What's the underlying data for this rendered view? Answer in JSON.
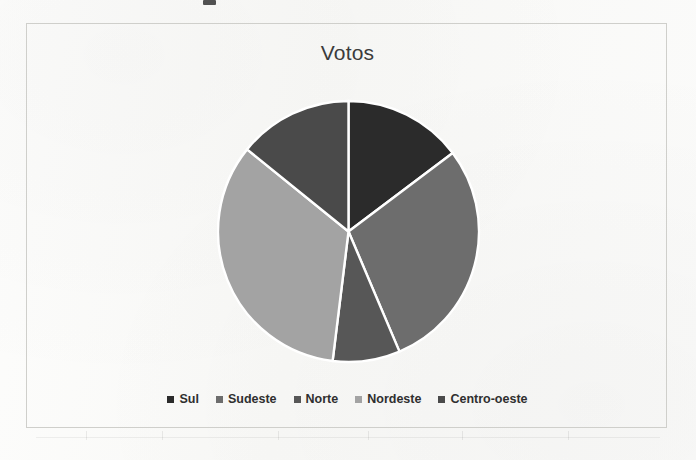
{
  "chart_data": {
    "type": "pie",
    "title": "Votos",
    "categories": [
      "Sul",
      "Sudeste",
      "Norte",
      "Nordeste",
      "Centro-oeste"
    ],
    "values": [
      14.7,
      28.9,
      8.3,
      33.9,
      14.2
    ],
    "units": "percent",
    "angles_deg": [
      53,
      104,
      30,
      122,
      51
    ],
    "start_angle_deg": 0,
    "direction": "clockwise",
    "colors": [
      "#2b2b2b",
      "#6d6d6d",
      "#575757",
      "#a3a3a3",
      "#4a4a4a"
    ],
    "slice_border_color": "#ffffff",
    "legend_position": "bottom",
    "grid": false,
    "xlabel": "",
    "ylabel": ""
  },
  "frame": {
    "border_color": "#cfcfcb"
  },
  "legend": {
    "items": [
      {
        "label": "Sul",
        "color": "#2b2b2b"
      },
      {
        "label": "Sudeste",
        "color": "#6d6d6d"
      },
      {
        "label": "Norte",
        "color": "#575757"
      },
      {
        "label": "Nordeste",
        "color": "#a3a3a3"
      },
      {
        "label": "Centro-oeste",
        "color": "#4a4a4a"
      }
    ]
  }
}
